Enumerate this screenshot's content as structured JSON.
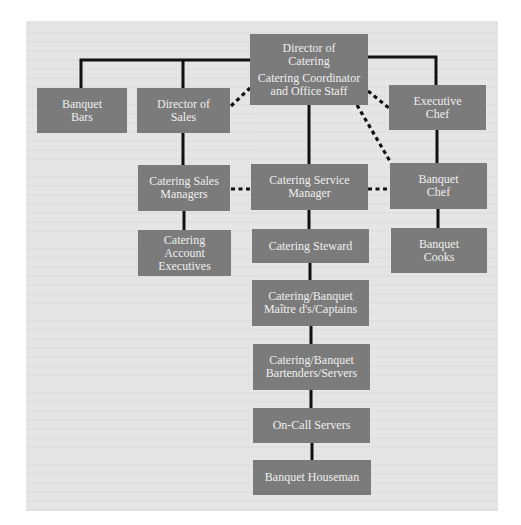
{
  "diagram": {
    "type": "organization-chart",
    "colors": {
      "background_panel": "#e4e4e4",
      "box_fill": "#7b7b7b",
      "box_text": "#efefef",
      "line": "#111111"
    },
    "nodes": {
      "director_of_catering": {
        "line1": "Director of",
        "line2": "Catering",
        "line3": "Catering Coordinator",
        "line4": "and Office Staff"
      },
      "banquet_bars": {
        "line1": "Banquet",
        "line2": "Bars"
      },
      "director_of_sales": {
        "line1": "Director of",
        "line2": "Sales"
      },
      "executive_chef": {
        "line1": "Executive",
        "line2": "Chef"
      },
      "catering_sales_managers": {
        "line1": "Catering Sales",
        "line2": "Managers"
      },
      "catering_service_manager": {
        "line1": "Catering Service",
        "line2": "Manager"
      },
      "banquet_chef": {
        "line1": "Banquet",
        "line2": "Chef"
      },
      "catering_account_executives": {
        "line1": "Catering",
        "line2": "Account",
        "line3": "Executives"
      },
      "catering_steward": {
        "line1": "Catering Steward"
      },
      "banquet_cooks": {
        "line1": "Banquet",
        "line2": "Cooks"
      },
      "maitre_d_captains": {
        "line1": "Catering/Banquet",
        "line2": "Maître d's/Captains"
      },
      "bartenders_servers": {
        "line1": "Catering/Banquet",
        "line2": "Bartenders/Servers"
      },
      "on_call_servers": {
        "line1": "On-Call Servers"
      },
      "banquet_houseman": {
        "line1": "Banquet Houseman"
      }
    },
    "edges_solid": [
      [
        "director_of_catering",
        "banquet_bars"
      ],
      [
        "director_of_catering",
        "director_of_sales"
      ],
      [
        "director_of_catering",
        "executive_chef"
      ],
      [
        "director_of_catering",
        "catering_service_manager"
      ],
      [
        "director_of_sales",
        "catering_sales_managers"
      ],
      [
        "catering_sales_managers",
        "catering_account_executives"
      ],
      [
        "catering_service_manager",
        "catering_steward"
      ],
      [
        "catering_steward",
        "maitre_d_captains"
      ],
      [
        "maitre_d_captains",
        "bartenders_servers"
      ],
      [
        "bartenders_servers",
        "on_call_servers"
      ],
      [
        "on_call_servers",
        "banquet_houseman"
      ],
      [
        "executive_chef",
        "banquet_chef"
      ],
      [
        "banquet_chef",
        "banquet_cooks"
      ]
    ],
    "edges_dashed": [
      [
        "director_of_catering",
        "director_of_sales"
      ],
      [
        "director_of_catering",
        "executive_chef"
      ],
      [
        "director_of_catering",
        "banquet_chef"
      ],
      [
        "catering_sales_managers",
        "catering_service_manager"
      ],
      [
        "catering_service_manager",
        "banquet_chef"
      ]
    ]
  }
}
